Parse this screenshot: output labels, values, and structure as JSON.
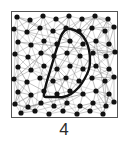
{
  "figure": {
    "caption": "4",
    "panel": {
      "border_color": "#555555",
      "background_color": "#ffffff",
      "width": 107,
      "height": 107
    },
    "styles": {
      "mesh_line_color": "#8d8d8d",
      "mesh_line_width": 0.45,
      "dot_color": "#111111",
      "dot_radius": 2.6,
      "contour_color": "#111111",
      "contour_width": 2.4
    }
  },
  "chart_data": {
    "type": "scatter",
    "title": "",
    "subtitle": "",
    "xlabel": "",
    "ylabel": "",
    "xlim": [
      0,
      107
    ],
    "ylim": [
      0,
      107
    ],
    "grid": false,
    "legend": null,
    "annotations": [
      {
        "name": "figure-number",
        "text": "4",
        "position": "below-panel-center"
      }
    ],
    "series": [
      {
        "name": "lattice-points",
        "marker": "filled-circle",
        "color": "#111111",
        "points": [
          [
            6,
            6
          ],
          [
            19,
            9
          ],
          [
            32,
            5
          ],
          [
            45,
            8
          ],
          [
            58,
            5
          ],
          [
            71,
            8
          ],
          [
            84,
            5
          ],
          [
            97,
            8
          ],
          [
            3,
            18
          ],
          [
            16,
            21
          ],
          [
            29,
            17
          ],
          [
            42,
            20
          ],
          [
            55,
            17
          ],
          [
            68,
            20
          ],
          [
            81,
            17
          ],
          [
            94,
            20
          ],
          [
            103,
            16
          ],
          [
            7,
            31
          ],
          [
            20,
            34
          ],
          [
            33,
            30
          ],
          [
            46,
            33
          ],
          [
            59,
            30
          ],
          [
            72,
            33
          ],
          [
            85,
            30
          ],
          [
            98,
            33
          ],
          [
            4,
            43
          ],
          [
            17,
            46
          ],
          [
            30,
            42
          ],
          [
            43,
            45
          ],
          [
            56,
            42
          ],
          [
            69,
            45
          ],
          [
            82,
            42
          ],
          [
            95,
            45
          ],
          [
            104,
            41
          ],
          [
            7,
            56
          ],
          [
            20,
            59
          ],
          [
            33,
            55
          ],
          [
            46,
            58
          ],
          [
            59,
            55
          ],
          [
            72,
            58
          ],
          [
            85,
            55
          ],
          [
            98,
            58
          ],
          [
            3,
            68
          ],
          [
            16,
            71
          ],
          [
            29,
            67
          ],
          [
            42,
            70
          ],
          [
            55,
            67
          ],
          [
            68,
            70
          ],
          [
            81,
            67
          ],
          [
            94,
            70
          ],
          [
            103,
            66
          ],
          [
            7,
            81
          ],
          [
            20,
            84
          ],
          [
            33,
            80
          ],
          [
            46,
            83
          ],
          [
            59,
            80
          ],
          [
            72,
            83
          ],
          [
            85,
            80
          ],
          [
            98,
            83
          ],
          [
            4,
            93
          ],
          [
            17,
            96
          ],
          [
            30,
            92
          ],
          [
            43,
            95
          ],
          [
            56,
            92
          ],
          [
            69,
            95
          ],
          [
            82,
            92
          ],
          [
            95,
            95
          ],
          [
            103,
            91
          ],
          [
            10,
            102
          ],
          [
            24,
            100
          ],
          [
            38,
            103
          ],
          [
            52,
            100
          ],
          [
            66,
            103
          ],
          [
            79,
            100
          ],
          [
            92,
            103
          ]
        ]
      },
      {
        "name": "domain-contour",
        "marker": "closed-curve",
        "color": "#111111",
        "closed": true,
        "points": [
          [
            56,
            18
          ],
          [
            63,
            19
          ],
          [
            70,
            23
          ],
          [
            75,
            30
          ],
          [
            78,
            39
          ],
          [
            79,
            49
          ],
          [
            78,
            58
          ],
          [
            74,
            67
          ],
          [
            68,
            76
          ],
          [
            60,
            83
          ],
          [
            52,
            86
          ],
          [
            44,
            86
          ],
          [
            36,
            86
          ],
          [
            33,
            85
          ],
          [
            34,
            78
          ],
          [
            36,
            70
          ],
          [
            39,
            60
          ],
          [
            42,
            50
          ],
          [
            45,
            40
          ],
          [
            48,
            31
          ],
          [
            51,
            23
          ],
          [
            56,
            18
          ]
        ]
      }
    ]
  }
}
